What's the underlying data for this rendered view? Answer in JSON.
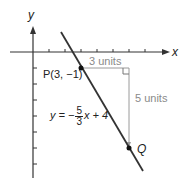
{
  "diagram": {
    "axes": {
      "x_label": "x",
      "y_label": "y"
    },
    "point_p": {
      "label": "P(3, −1)",
      "x": 3,
      "y": -1
    },
    "point_q": {
      "label": "Q",
      "x": 6,
      "y": -6
    },
    "horizontal_run": {
      "label": "3 units"
    },
    "vertical_rise": {
      "label": "5 units"
    },
    "equation": {
      "lhs": "y = −",
      "numerator": "5",
      "denominator": "3",
      "rhs": "x + 4"
    },
    "colors": {
      "line": "#333333",
      "guide": "#9a9a9a",
      "axis": "#333333"
    }
  }
}
